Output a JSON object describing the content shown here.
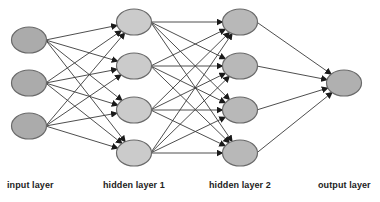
{
  "diagram": {
    "type": "feedforward-neural-network",
    "colors": {
      "input_fill": "#ababab",
      "hidden1_fill": "#cbcbcb",
      "hidden2_fill": "#b8b8b8",
      "output_fill": "#b0b0b0",
      "edge": "#3a3a3a",
      "arrowhead": "#1a1a1a",
      "node_stroke": "#6a6a6a"
    },
    "node_size": {
      "rx": 17.5,
      "ry": 13
    },
    "layers": [
      {
        "name": "input",
        "label": "input layer",
        "x": 29,
        "ys": [
          40,
          83,
          126
        ],
        "label_x": 7,
        "fill_key": "input_fill"
      },
      {
        "name": "hidden1",
        "label": "hidden layer 1",
        "x": 134,
        "ys": [
          22,
          66,
          110,
          153
        ],
        "label_x": 103,
        "fill_key": "hidden1_fill"
      },
      {
        "name": "hidden2",
        "label": "hidden layer 2",
        "x": 240,
        "ys": [
          22,
          66,
          110,
          153
        ],
        "label_x": 209,
        "fill_key": "hidden2_fill"
      },
      {
        "name": "output",
        "label": "output layer",
        "x": 344,
        "ys": [
          83
        ],
        "label_x": 318,
        "fill_key": "output_fill"
      }
    ],
    "connectivity": "fully-connected between consecutive layers, arrows pointing right"
  }
}
